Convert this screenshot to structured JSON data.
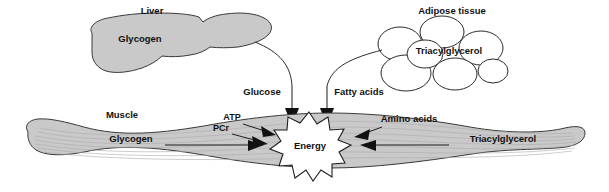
{
  "diagram": {
    "background_color": "#ffffff",
    "organ_fill_color": "#c9c9c9",
    "outline_color": "#2b2b2b",
    "text_color": "#111111"
  },
  "liver": {
    "label": "Liver",
    "store_label": "Glycogen"
  },
  "adipose": {
    "label": "Adipose tissue",
    "store_label": "Triacylglycerol"
  },
  "transport": {
    "glucose_label": "Glucose",
    "fatty_acids_label": "Fatty acids"
  },
  "muscle": {
    "label": "Muscle",
    "energy_label": "Energy",
    "inputs_left": [
      {
        "label": "ATP"
      },
      {
        "label": "PCr"
      },
      {
        "label": "Glycogen"
      }
    ],
    "inputs_right": [
      {
        "label": "Amino acids"
      },
      {
        "label": "Triacylglycerol"
      }
    ]
  }
}
